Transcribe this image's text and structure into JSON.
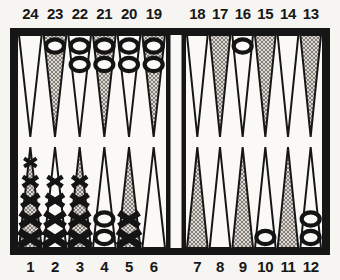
{
  "diagram": {
    "game": "backgammon",
    "o_symbol": "O",
    "x_symbol": "X"
  },
  "colors": {
    "page_bg": "#f6f5f1",
    "frame": "#161616",
    "field": "#faf9f5",
    "bar_strip": "#faf9f5",
    "point_outline": "#161616",
    "shade_base": "#ddd9d2",
    "shade_line": "#827f7a",
    "checker_outline": "#141414",
    "checker_fill": "#fbfaf7",
    "label": "#171717"
  },
  "top_numbers": [
    "24",
    "23",
    "22",
    "21",
    "20",
    "19",
    "18",
    "17",
    "16",
    "15",
    "14",
    "13"
  ],
  "bottom_numbers": [
    "1",
    "2",
    "3",
    "4",
    "5",
    "6",
    "7",
    "8",
    "9",
    "10",
    "11",
    "12"
  ],
  "points": [
    {
      "number": 24,
      "shaded": false,
      "checker": null,
      "count": 0
    },
    {
      "number": 23,
      "shaded": true,
      "checker": "O",
      "count": 1
    },
    {
      "number": 22,
      "shaded": false,
      "checker": "O",
      "count": 2
    },
    {
      "number": 21,
      "shaded": true,
      "checker": "O",
      "count": 2
    },
    {
      "number": 20,
      "shaded": false,
      "checker": "O",
      "count": 2
    },
    {
      "number": 19,
      "shaded": true,
      "checker": "O",
      "count": 2
    },
    {
      "number": 18,
      "shaded": false,
      "checker": null,
      "count": 0
    },
    {
      "number": 17,
      "shaded": true,
      "checker": null,
      "count": 0
    },
    {
      "number": 16,
      "shaded": false,
      "checker": "O",
      "count": 1
    },
    {
      "number": 15,
      "shaded": true,
      "checker": null,
      "count": 0
    },
    {
      "number": 14,
      "shaded": false,
      "checker": null,
      "count": 0
    },
    {
      "number": 13,
      "shaded": true,
      "checker": null,
      "count": 0
    },
    {
      "number": 12,
      "shaded": false,
      "checker": "O",
      "count": 2
    },
    {
      "number": 11,
      "shaded": true,
      "checker": null,
      "count": 0
    },
    {
      "number": 10,
      "shaded": false,
      "checker": "O",
      "count": 1
    },
    {
      "number": 9,
      "shaded": true,
      "checker": null,
      "count": 0
    },
    {
      "number": 8,
      "shaded": false,
      "checker": null,
      "count": 0
    },
    {
      "number": 7,
      "shaded": true,
      "checker": null,
      "count": 0
    },
    {
      "number": 6,
      "shaded": false,
      "checker": null,
      "count": 0
    },
    {
      "number": 5,
      "shaded": true,
      "checker": "X",
      "count": 2
    },
    {
      "number": 4,
      "shaded": false,
      "checker": "O",
      "count": 2
    },
    {
      "number": 3,
      "shaded": true,
      "checker": "X",
      "count": 4
    },
    {
      "number": 2,
      "shaded": false,
      "checker": "X",
      "count": 4
    },
    {
      "number": 1,
      "shaded": true,
      "checker": "X",
      "count": 5
    }
  ]
}
